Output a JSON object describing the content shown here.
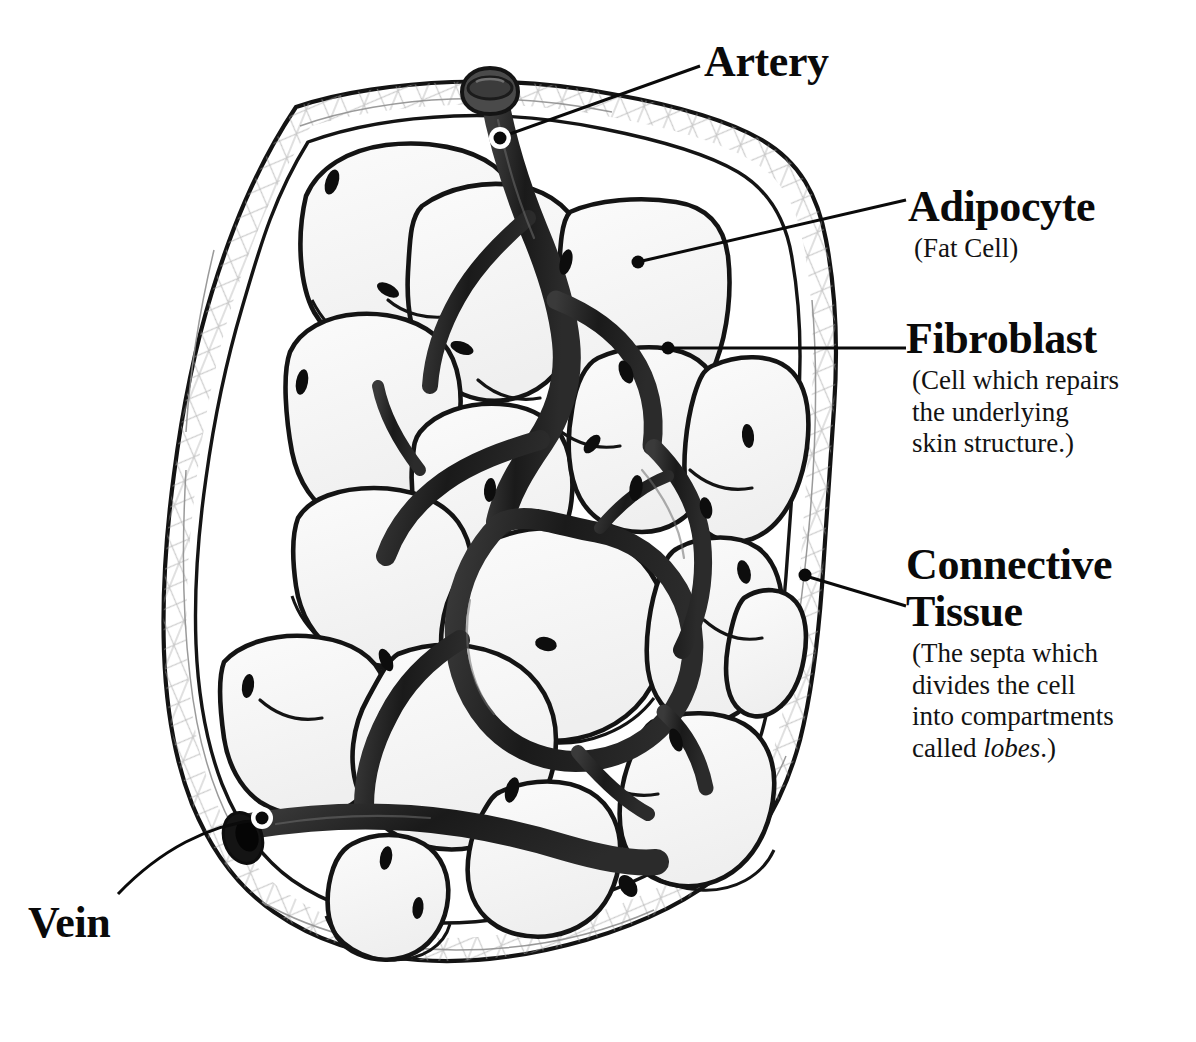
{
  "figure": {
    "style": "hand-drawn black ink line illustration",
    "background_color": "#ffffff",
    "ink_color": "#111111",
    "cell_fill_color": "#f4f4f4",
    "capsule_fiber_color": "#9a9a9a"
  },
  "labels": {
    "artery": {
      "title": "Artery",
      "subtitle": "",
      "leader": {
        "type": "straight",
        "dot_x": 500,
        "dot_y": 138,
        "halo": true
      }
    },
    "adipocyte": {
      "title": "Adipocyte",
      "subtitle": "(Fat Cell)",
      "leader": {
        "type": "straight",
        "dot_x": 638,
        "dot_y": 262,
        "halo": false
      }
    },
    "fibroblast": {
      "title": "Fibroblast",
      "subtitle_lines": [
        "(Cell which repairs",
        "the underlying",
        "skin structure.)"
      ],
      "leader": {
        "type": "straight",
        "dot_x": 668,
        "dot_y": 348,
        "halo": false
      }
    },
    "connective_tissue": {
      "title_line_1": "Connective",
      "title_line_2": "Tissue",
      "subtitle_lines": [
        "(The septa which",
        "divides the cell",
        "into compartments",
        "called "
      ],
      "italic_word": "lobes",
      "subtitle_tail": ".)",
      "leader": {
        "type": "straight",
        "dot_x": 805,
        "dot_y": 575,
        "halo": false
      }
    },
    "vein": {
      "title": "Vein",
      "subtitle": "",
      "leader": {
        "type": "curved",
        "dot_x": 262,
        "dot_y": 818,
        "halo": true
      }
    }
  },
  "caption": {
    "text": "",
    "visible": false
  },
  "anatomy": {
    "capsule": {
      "name": "connective tissue capsule",
      "description": "irregular closed outer band with fibrous cross-hatch texture"
    },
    "adipocyte_count": 16,
    "vessels": [
      {
        "name": "artery",
        "entry": "top",
        "entry_x": 480,
        "entry_y": 85
      },
      {
        "name": "vein",
        "entry": "bottom-left",
        "entry_x": 232,
        "entry_y": 830
      }
    ]
  }
}
